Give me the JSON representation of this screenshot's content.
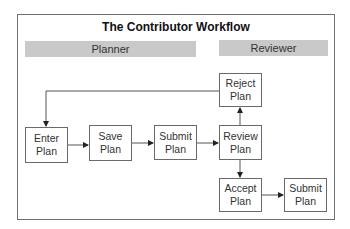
{
  "title": "The Contributor Workflow",
  "lanes": {
    "planner": "Planner",
    "reviewer": "Reviewer"
  },
  "nodes": {
    "enter": {
      "line1": "Enter",
      "line2": "Plan"
    },
    "save": {
      "line1": "Save",
      "line2": "Plan"
    },
    "submit": {
      "line1": "Submit",
      "line2": "Plan"
    },
    "review": {
      "line1": "Review",
      "line2": "Plan"
    },
    "reject": {
      "line1": "Reject",
      "line2": "Plan"
    },
    "accept": {
      "line1": "Accept",
      "line2": "Plan"
    },
    "submit_final": {
      "line1": "Submit",
      "line2": "Plan"
    }
  },
  "edges": [
    {
      "from": "enter",
      "to": "save"
    },
    {
      "from": "save",
      "to": "submit"
    },
    {
      "from": "submit",
      "to": "review"
    },
    {
      "from": "review",
      "to": "reject"
    },
    {
      "from": "reject",
      "to": "enter"
    },
    {
      "from": "review",
      "to": "accept"
    },
    {
      "from": "accept",
      "to": "submit_final"
    }
  ],
  "colors": {
    "lane_bg": "#c9c9c9",
    "border": "#6a6a6a",
    "arrow": "#222222"
  }
}
